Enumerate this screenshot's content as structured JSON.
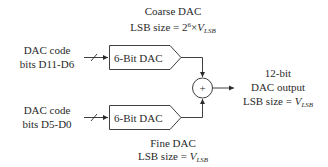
{
  "diagram": {
    "coarse_dac": {
      "title": "Coarse DAC",
      "lsb_prefix": "LSB size = 2",
      "lsb_exp": "6",
      "lsb_times": "×",
      "lsb_v": "V",
      "lsb_sub": "LSB",
      "block_label": "6-Bit DAC"
    },
    "fine_dac": {
      "title": "Fine DAC",
      "lsb_prefix": "LSB size = ",
      "lsb_v": "V",
      "lsb_sub": "LSB",
      "block_label": "6-Bit DAC"
    },
    "input_top": {
      "line1": "DAC code",
      "line2": "bits D11-D6"
    },
    "input_bottom": {
      "line1": "DAC code",
      "line2": "bits D5-D0"
    },
    "summer": {
      "symbol": "+"
    },
    "output": {
      "line1": "12-bit",
      "line2": "DAC output",
      "lsb_prefix": "LSB size = ",
      "lsb_v": "V",
      "lsb_sub": "LSB"
    },
    "colors": {
      "stroke": "#2a2a2a",
      "background": "#ffffff"
    }
  }
}
